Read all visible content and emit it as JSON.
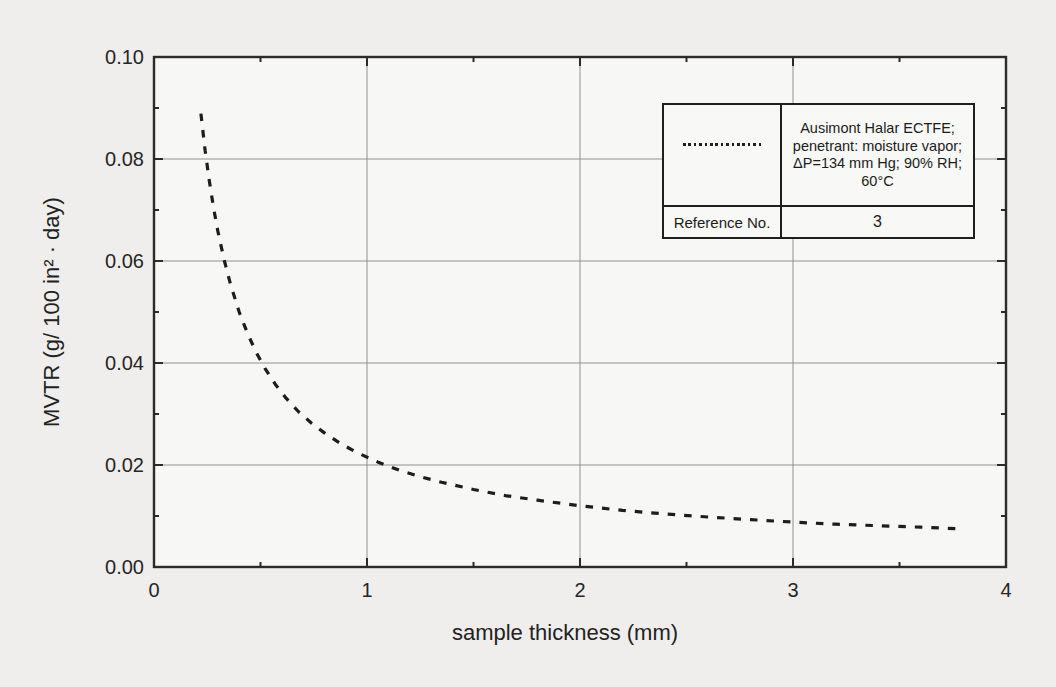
{
  "chart_data": {
    "type": "line",
    "title": "",
    "xlabel": "sample thickness (mm)",
    "ylabel": "MVTR (g/ 100 in² · day)",
    "xlim": [
      0,
      4
    ],
    "ylim": [
      0,
      0.1
    ],
    "x_ticks": [
      0,
      1,
      2,
      3,
      4
    ],
    "x_tick_labels": [
      "0",
      "1",
      "2",
      "3",
      "4"
    ],
    "x_minor_ticks": [
      0.5,
      1.5,
      2.5,
      3.5
    ],
    "y_ticks": [
      0,
      0.02,
      0.04,
      0.06,
      0.08,
      0.1
    ],
    "y_tick_labels": [
      "0.00",
      "0.02",
      "0.04",
      "0.06",
      "0.08",
      "0.10"
    ],
    "y_minor_ticks": [
      0.01,
      0.03,
      0.05,
      0.07,
      0.09
    ],
    "grid": true,
    "legend_position": "top-right",
    "series": [
      {
        "name": "Ausimont Halar ECTFE; penetrant: moisture vapor; ΔP=134 mm Hg; 90% RH; 60°C",
        "reference_no": "3",
        "line_style": "dashed-dotted",
        "color": "#1d1d1d",
        "points": [
          [
            0.22,
            0.0889
          ],
          [
            0.24,
            0.0817
          ],
          [
            0.26,
            0.0756
          ],
          [
            0.28,
            0.0704
          ],
          [
            0.3,
            0.0658
          ],
          [
            0.33,
            0.0601
          ],
          [
            0.36,
            0.0553
          ],
          [
            0.4,
            0.05
          ],
          [
            0.44,
            0.0457
          ],
          [
            0.48,
            0.0421
          ],
          [
            0.52,
            0.039
          ],
          [
            0.57,
            0.0358
          ],
          [
            0.62,
            0.0331
          ],
          [
            0.68,
            0.0304
          ],
          [
            0.74,
            0.0282
          ],
          [
            0.8,
            0.0263
          ],
          [
            0.88,
            0.0241
          ],
          [
            0.96,
            0.0223
          ],
          [
            1.05,
            0.0206
          ],
          [
            1.15,
            0.019
          ],
          [
            1.25,
            0.0177
          ],
          [
            1.35,
            0.0166
          ],
          [
            1.5,
            0.0152
          ],
          [
            1.65,
            0.014
          ],
          [
            1.8,
            0.0131
          ],
          [
            2.0,
            0.012
          ],
          [
            2.2,
            0.0111
          ],
          [
            2.4,
            0.0104
          ],
          [
            2.6,
            0.0098
          ],
          [
            2.8,
            0.0093
          ],
          [
            3.0,
            0.0088
          ],
          [
            3.2,
            0.0084
          ],
          [
            3.4,
            0.0081
          ],
          [
            3.6,
            0.0078
          ],
          [
            3.78,
            0.0075
          ]
        ]
      }
    ]
  },
  "legend": {
    "description_lines": [
      "Ausimont Halar ECTFE;",
      "penetrant: moisture vapor;",
      "ΔP=134 mm Hg; 90% RH;",
      "60°C"
    ],
    "reference_label": "Reference No.",
    "reference_value": "3"
  },
  "colors": {
    "page_background": "#efeeec",
    "plot_background": "#f7f7f5",
    "axis": "#2b2b2b",
    "grid": "#919191",
    "curve": "#1d1d1d"
  }
}
